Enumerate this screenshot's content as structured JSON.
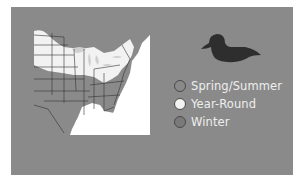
{
  "map": {
    "region": "Eastern United States",
    "colors": {
      "background": "#8a8a8a",
      "spring_summer": "#8a8a8a",
      "year_round": "#f2f2f2",
      "winter": "#7a7a7a",
      "water": "#ffffff",
      "borders": "#333333"
    }
  },
  "bird": {
    "icon": "duck-silhouette-icon"
  },
  "legend": {
    "items": [
      {
        "label": "Spring/Summer",
        "color": "#8a8a8a"
      },
      {
        "label": "Year-Round",
        "color": "#f2f2f2"
      },
      {
        "label": "Winter",
        "color": "#7a7a7a"
      }
    ]
  }
}
